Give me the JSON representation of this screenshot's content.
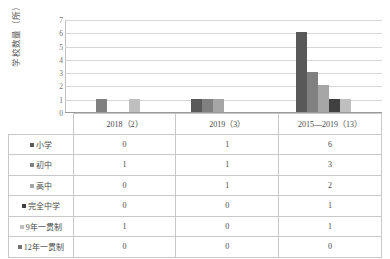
{
  "chart_data": {
    "type": "bar",
    "title": "",
    "xlabel": "",
    "ylabel": "学校数量（所）",
    "ylim": [
      0,
      7
    ],
    "yticks": [
      0,
      1,
      2,
      3,
      4,
      5,
      6,
      7
    ],
    "grid": true,
    "legend_position": "table-row-headers",
    "categories": [
      "2018（2）",
      "2019（3）",
      "2015—2019（13）"
    ],
    "series": [
      {
        "name": "小学",
        "color": "#595959",
        "values": [
          0,
          1,
          6
        ]
      },
      {
        "name": "初中",
        "color": "#808080",
        "values": [
          1,
          1,
          3
        ]
      },
      {
        "name": "高中",
        "color": "#a6a6a6",
        "values": [
          0,
          1,
          2
        ]
      },
      {
        "name": "完全中学",
        "color": "#404040",
        "values": [
          0,
          0,
          1
        ]
      },
      {
        "name": "9年一贯制",
        "color": "#bfbfbf",
        "values": [
          1,
          0,
          1
        ]
      },
      {
        "name": "12年一贯制",
        "color": "#737373",
        "values": [
          0,
          0,
          0
        ]
      }
    ]
  },
  "table": {
    "corner": "",
    "column_headers": [
      "2018（2）",
      "2019（3）",
      "2015—2019（13）"
    ],
    "rows": [
      {
        "label": "小学",
        "swatch": "#595959",
        "values": [
          "0",
          "1",
          "6"
        ]
      },
      {
        "label": "初中",
        "swatch": "#808080",
        "values": [
          "1",
          "1",
          "3"
        ]
      },
      {
        "label": "高中",
        "swatch": "#a6a6a6",
        "values": [
          "0",
          "1",
          "2"
        ]
      },
      {
        "label": "完全中学",
        "swatch": "#404040",
        "values": [
          "0",
          "0",
          "1"
        ]
      },
      {
        "label": "9年一贯制",
        "swatch": "#bfbfbf",
        "values": [
          "1",
          "0",
          "1"
        ]
      },
      {
        "label": "12年一贯制",
        "swatch": "#737373",
        "values": [
          "0",
          "0",
          "0"
        ]
      }
    ]
  }
}
